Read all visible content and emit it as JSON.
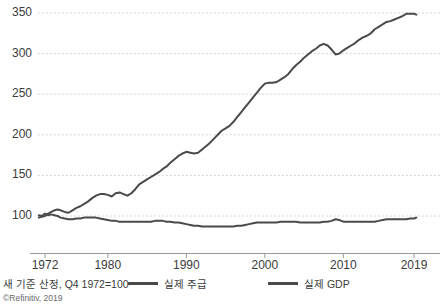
{
  "chart_data": {
    "type": "line",
    "title": "",
    "subtitle": "",
    "xlabel": "",
    "ylabel": "",
    "xlim": [
      1971.0,
      2019.5
    ],
    "ylim": [
      70,
      360
    ],
    "ytick_labels": [
      "100",
      "150",
      "200",
      "250",
      "300",
      "350"
    ],
    "ytick_values": [
      100,
      150,
      200,
      250,
      300,
      350
    ],
    "xtick_labels": [
      "1972",
      "1980",
      "1990",
      "2000",
      "2010",
      "2019"
    ],
    "xtick_values": [
      1972,
      1980,
      1990,
      2000,
      2010,
      2019
    ],
    "grid": "horizontal-dotted",
    "legend_position": "below-axis",
    "note": "새 기준 산정, Q4 1972=100",
    "source": "©Refinitiv, 2019",
    "series": [
      {
        "name": "실제 주급",
        "color": "#4a4a4a",
        "x": [
          1971.2,
          1971.6,
          1972.0,
          1972.4,
          1972.8,
          1973.2,
          1973.6,
          1974.0,
          1974.5,
          1975.0,
          1975.5,
          1976.0,
          1976.5,
          1977.0,
          1977.5,
          1978.0,
          1978.5,
          1979.0,
          1979.5,
          1980.0,
          1980.5,
          1981.0,
          1981.5,
          1982.0,
          1982.5,
          1983.0,
          1983.5,
          1984.0,
          1984.5,
          1985.0,
          1985.5,
          1986.0,
          1986.5,
          1987.0,
          1987.5,
          1988.0,
          1988.5,
          1989.0,
          1989.5,
          1990.0,
          1990.5,
          1991.0,
          1991.5,
          1992.0,
          1992.5,
          1993.0,
          1993.5,
          1994.0,
          1994.5,
          1995.0,
          1995.5,
          1996.0,
          1996.5,
          1997.0,
          1997.5,
          1998.0,
          1998.5,
          1999.0,
          1999.5,
          2000.0,
          2000.5,
          2001.0,
          2001.5,
          2002.0,
          2002.5,
          2003.0,
          2003.5,
          2004.0,
          2004.5,
          2005.0,
          2005.5,
          2006.0,
          2006.5,
          2007.0,
          2007.5,
          2008.0,
          2008.5,
          2009.0,
          2009.5,
          2010.0,
          2010.5,
          2011.0,
          2011.5,
          2012.0,
          2012.5,
          2013.0,
          2013.5,
          2014.0,
          2014.5,
          2015.0,
          2015.5,
          2016.0,
          2016.5,
          2017.0,
          2017.5,
          2018.0,
          2018.5,
          2019.0,
          2019.3
        ],
        "y": [
          101,
          100,
          103,
          101,
          102,
          101,
          100,
          98,
          97,
          96,
          96,
          97,
          97,
          98,
          98,
          98,
          98,
          97,
          96,
          95,
          94,
          94,
          93,
          93,
          93,
          93,
          93,
          93,
          93,
          93,
          93,
          94,
          94,
          94,
          93,
          93,
          92,
          92,
          91,
          90,
          89,
          88,
          88,
          87,
          87,
          87,
          87,
          87,
          87,
          87,
          87,
          87,
          88,
          88,
          89,
          90,
          91,
          92,
          92,
          92,
          92,
          92,
          92,
          93,
          93,
          93,
          93,
          93,
          92,
          92,
          92,
          92,
          92,
          92,
          93,
          93,
          94,
          96,
          95,
          93,
          93,
          93,
          93,
          93,
          93,
          93,
          93,
          93,
          94,
          95,
          96,
          96,
          96,
          96,
          96,
          96,
          97,
          97,
          98
        ]
      },
      {
        "name": "실제 GDP",
        "color": "#4a4a4a",
        "x": [
          1971.2,
          1971.6,
          1972.0,
          1972.4,
          1972.8,
          1973.2,
          1973.6,
          1974.0,
          1974.5,
          1975.0,
          1975.5,
          1976.0,
          1976.5,
          1977.0,
          1977.5,
          1978.0,
          1978.5,
          1979.0,
          1979.5,
          1980.0,
          1980.5,
          1981.0,
          1981.5,
          1982.0,
          1982.5,
          1983.0,
          1983.5,
          1984.0,
          1984.5,
          1985.0,
          1985.5,
          1986.0,
          1986.5,
          1987.0,
          1987.5,
          1988.0,
          1988.5,
          1989.0,
          1989.5,
          1990.0,
          1990.5,
          1991.0,
          1991.5,
          1992.0,
          1992.5,
          1993.0,
          1993.5,
          1994.0,
          1994.5,
          1995.0,
          1995.5,
          1996.0,
          1996.5,
          1997.0,
          1997.5,
          1998.0,
          1998.5,
          1999.0,
          1999.5,
          2000.0,
          2000.5,
          2001.0,
          2001.5,
          2002.0,
          2002.5,
          2003.0,
          2003.5,
          2004.0,
          2004.5,
          2005.0,
          2005.5,
          2006.0,
          2006.5,
          2007.0,
          2007.5,
          2008.0,
          2008.5,
          2009.0,
          2009.5,
          2010.0,
          2010.5,
          2011.0,
          2011.5,
          2012.0,
          2012.5,
          2013.0,
          2013.5,
          2014.0,
          2014.5,
          2015.0,
          2015.5,
          2016.0,
          2016.5,
          2017.0,
          2017.5,
          2018.0,
          2018.5,
          2019.0,
          2019.3
        ],
        "y": [
          98,
          99,
          100,
          103,
          105,
          107,
          108,
          107,
          105,
          104,
          107,
          110,
          112,
          115,
          118,
          122,
          125,
          127,
          127,
          126,
          124,
          128,
          129,
          127,
          125,
          128,
          133,
          139,
          142,
          145,
          148,
          151,
          154,
          158,
          161,
          166,
          170,
          174,
          177,
          179,
          178,
          177,
          178,
          182,
          186,
          190,
          195,
          200,
          205,
          208,
          211,
          216,
          222,
          228,
          234,
          240,
          246,
          252,
          258,
          263,
          264,
          264,
          265,
          268,
          271,
          275,
          281,
          286,
          290,
          295,
          299,
          303,
          306,
          310,
          312,
          310,
          305,
          299,
          300,
          304,
          307,
          310,
          313,
          317,
          320,
          322,
          325,
          330,
          333,
          336,
          339,
          340,
          342,
          344,
          346,
          349,
          349,
          349,
          348
        ]
      }
    ]
  },
  "axis": {
    "baseline_color": "#999999",
    "grid_color": "#c8c8c8"
  },
  "legend": {
    "items": [
      {
        "label": "실제 주급"
      },
      {
        "label": "실제 GDP"
      }
    ]
  }
}
